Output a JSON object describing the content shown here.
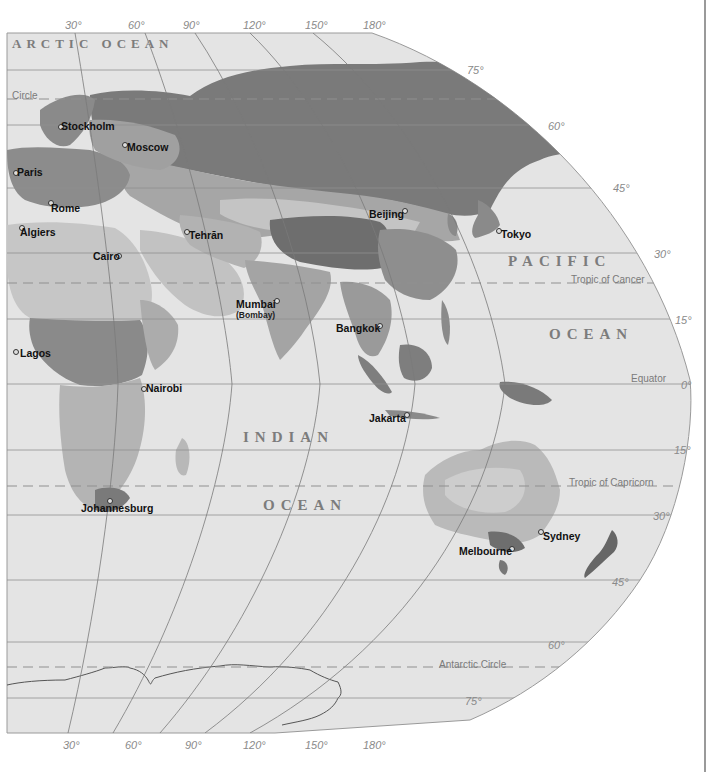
{
  "map": {
    "projection": "Eastern Hemisphere",
    "colors": {
      "ocean": "#e4e4e4",
      "land_lightest": "#cfcfcf",
      "land_light": "#b8b8b8",
      "land_medium": "#9c9c9c",
      "land_dark": "#7c7c7c",
      "land_darkest": "#666666",
      "graticule": "#8f8f8f",
      "borders": "#1f1f1f"
    },
    "longitude_labels_top": [
      "30°",
      "60°",
      "90°",
      "120°",
      "150°",
      "180°"
    ],
    "longitude_labels_bottom": [
      "30°",
      "60°",
      "90°",
      "120°",
      "150°",
      "180°"
    ],
    "latitude_labels": [
      "75°",
      "60°",
      "45°",
      "30°",
      "15°",
      "0°",
      "15°",
      "30°",
      "45°",
      "60°",
      "75°"
    ],
    "special_lines": {
      "arctic_circle": "Circle",
      "tropic_of_cancer": "Tropic of Cancer",
      "equator": "Equator",
      "tropic_of_capricorn": "Tropic of Capricorn",
      "antarctic_circle": "Antarctic Circle"
    },
    "oceans": {
      "arctic": "ARCTIC OCEAN",
      "pacific_1": "PACIFIC",
      "pacific_2": "OCEAN",
      "indian_1": "INDIAN",
      "indian_2": "OCEAN"
    },
    "cities": [
      {
        "name": "Stockholm"
      },
      {
        "name": "Moscow"
      },
      {
        "name": "Paris"
      },
      {
        "name": "Rome"
      },
      {
        "name": "Algiers"
      },
      {
        "name": "Tehrān"
      },
      {
        "name": "Cairo"
      },
      {
        "name": "Beijing"
      },
      {
        "name": "Tokyo"
      },
      {
        "name": "Mumbai",
        "subtitle": "(Bombay)"
      },
      {
        "name": "Bangkok"
      },
      {
        "name": "Lagos"
      },
      {
        "name": "Nairobi"
      },
      {
        "name": "Jakarta"
      },
      {
        "name": "Johannesburg"
      },
      {
        "name": "Sydney"
      },
      {
        "name": "Melbourne"
      }
    ]
  }
}
